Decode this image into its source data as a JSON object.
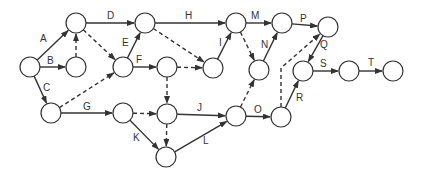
{
  "diagram": {
    "type": "activity-on-arrow network",
    "node_radius": 10,
    "colors": {
      "stroke": "#333333",
      "background": "#ffffff"
    },
    "nodes": [
      {
        "id": "n1",
        "x": 30,
        "y": 67
      },
      {
        "id": "n2",
        "x": 76,
        "y": 23
      },
      {
        "id": "n3",
        "x": 76,
        "y": 67
      },
      {
        "id": "n4",
        "x": 51,
        "y": 113
      },
      {
        "id": "n5",
        "x": 145,
        "y": 23
      },
      {
        "id": "n6",
        "x": 123,
        "y": 67
      },
      {
        "id": "n7",
        "x": 167,
        "y": 67
      },
      {
        "id": "n8",
        "x": 236,
        "y": 23
      },
      {
        "id": "n9",
        "x": 213,
        "y": 68
      },
      {
        "id": "n10",
        "x": 123,
        "y": 113
      },
      {
        "id": "n11",
        "x": 167,
        "y": 114
      },
      {
        "id": "n12",
        "x": 166,
        "y": 157
      },
      {
        "id": "n13",
        "x": 236,
        "y": 116
      },
      {
        "id": "n14",
        "x": 259,
        "y": 70
      },
      {
        "id": "n15",
        "x": 282,
        "y": 23
      },
      {
        "id": "n16",
        "x": 328,
        "y": 27
      },
      {
        "id": "n17",
        "x": 281,
        "y": 117
      },
      {
        "id": "n18",
        "x": 303,
        "y": 71
      },
      {
        "id": "n19",
        "x": 349,
        "y": 71
      },
      {
        "id": "n20",
        "x": 393,
        "y": 71
      }
    ],
    "activities": [
      {
        "label": "A",
        "from": "n1",
        "to": "n2",
        "lx": 40,
        "ly": 42
      },
      {
        "label": "B",
        "from": "n1",
        "to": "n3",
        "lx": 47,
        "ly": 64
      },
      {
        "label": "C",
        "from": "n1",
        "to": "n4",
        "lx": 43,
        "ly": 91
      },
      {
        "label": "D",
        "from": "n2",
        "to": "n5",
        "lx": 107,
        "ly": 19
      },
      {
        "label": "E",
        "from": "n6",
        "to": "n5",
        "lx": 122,
        "ly": 46
      },
      {
        "label": "F",
        "from": "n6",
        "to": "n7",
        "lx": 136,
        "ly": 63
      },
      {
        "label": "G",
        "from": "n4",
        "to": "n10",
        "lx": 83,
        "ly": 110
      },
      {
        "label": "H",
        "from": "n5",
        "to": "n8",
        "lx": 185,
        "ly": 19
      },
      {
        "label": "I",
        "from": "n9",
        "to": "n8",
        "lx": 219,
        "ly": 46
      },
      {
        "label": "J",
        "from": "n11",
        "to": "n13",
        "lx": 197,
        "ly": 111
      },
      {
        "label": "K",
        "from": "n10",
        "to": "n12",
        "lx": 133,
        "ly": 141
      },
      {
        "label": "L",
        "from": "n12",
        "to": "n13",
        "lx": 203,
        "ly": 144
      },
      {
        "label": "M",
        "from": "n8",
        "to": "n15",
        "lx": 251,
        "ly": 19
      },
      {
        "label": "N",
        "from": "n14",
        "to": "n15",
        "lx": 261,
        "ly": 48
      },
      {
        "label": "O",
        "from": "n13",
        "to": "n17",
        "lx": 254,
        "ly": 113
      },
      {
        "label": "P",
        "from": "n15",
        "to": "n16",
        "lx": 300,
        "ly": 22
      },
      {
        "label": "Q",
        "from": "n16",
        "to": "n18",
        "lx": 320,
        "ly": 48
      },
      {
        "label": "R",
        "from": "n17",
        "to": "n18",
        "lx": 296,
        "ly": 101
      },
      {
        "label": "S",
        "from": "n18",
        "to": "n19",
        "lx": 320,
        "ly": 67
      },
      {
        "label": "T",
        "from": "n19",
        "to": "n20",
        "lx": 368,
        "ly": 66
      }
    ],
    "dummies": [
      {
        "from": "n3",
        "to": "n2"
      },
      {
        "from": "n2",
        "to": "n6"
      },
      {
        "from": "n4",
        "to": "n6"
      },
      {
        "from": "n5",
        "to": "n9"
      },
      {
        "from": "n7",
        "to": "n9"
      },
      {
        "from": "n7",
        "to": "n11"
      },
      {
        "from": "n10",
        "to": "n11"
      },
      {
        "from": "n11",
        "to": "n12"
      },
      {
        "from": "n8",
        "to": "n14"
      },
      {
        "from": "n13",
        "to": "n14"
      },
      {
        "from": "n17",
        "to": "n16",
        "via": [
          [
            281,
            68
          ]
        ]
      }
    ]
  }
}
